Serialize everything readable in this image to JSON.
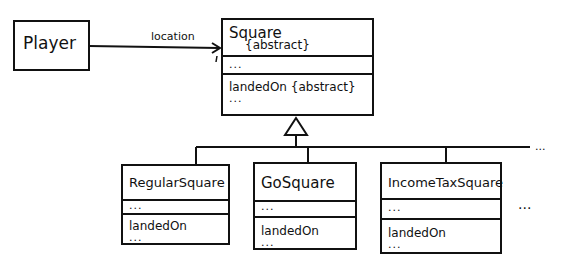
{
  "classes": {
    "player": {
      "name": "Player"
    },
    "square": {
      "name": "Square",
      "stereotype": "{abstract}",
      "attributes": "...",
      "method": "landedOn {abstract}",
      "more": "..."
    },
    "regular": {
      "name": "RegularSquare",
      "attributes": "...",
      "method": "landedOn",
      "more": "..."
    },
    "go": {
      "name": "GoSquare",
      "attributes": "...",
      "method": "landedOn",
      "more": "..."
    },
    "incometax": {
      "name": "IncomeTaxSquare",
      "attributes": "...",
      "method": "landedOn",
      "more": "..."
    }
  },
  "association": {
    "label": "location"
  },
  "ellipsis": {
    "line": "...",
    "more_classes": "..."
  }
}
